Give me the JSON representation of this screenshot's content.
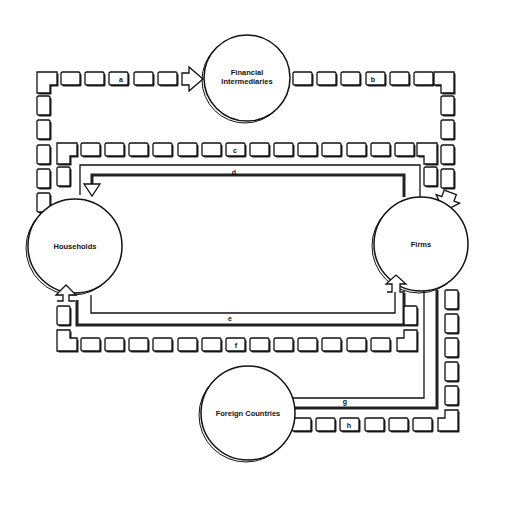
{
  "diagram": {
    "type": "circular-flow",
    "nodes": [
      {
        "id": "financial",
        "label_line1": "Financial",
        "label_line2": "Intermediaries"
      },
      {
        "id": "households",
        "label": "Households"
      },
      {
        "id": "firms",
        "label": "Firms"
      },
      {
        "id": "foreign",
        "label": "Foreign Countries"
      }
    ],
    "flows": [
      {
        "id": "a",
        "label": "a",
        "from": "Households",
        "to": "Financial Intermediaries",
        "style": "block-chain"
      },
      {
        "id": "b",
        "label": "b",
        "from": "Financial Intermediaries",
        "to": "Firms",
        "style": "block-chain"
      },
      {
        "id": "c",
        "label": "c",
        "from": "Firms",
        "to": "Households",
        "style": "block-chain"
      },
      {
        "id": "d",
        "label": "d",
        "from": "Firms",
        "to": "Households",
        "style": "line"
      },
      {
        "id": "e",
        "label": "e",
        "from": "Households",
        "to": "Firms",
        "style": "line"
      },
      {
        "id": "f",
        "label": "f",
        "from": "Households",
        "to": "Firms",
        "style": "block-chain"
      },
      {
        "id": "g",
        "label": "g",
        "from": "Firms",
        "to": "Foreign Countries",
        "style": "line"
      },
      {
        "id": "h",
        "label": "h",
        "from": "Foreign Countries",
        "to": "Firms",
        "style": "block-chain"
      }
    ]
  }
}
